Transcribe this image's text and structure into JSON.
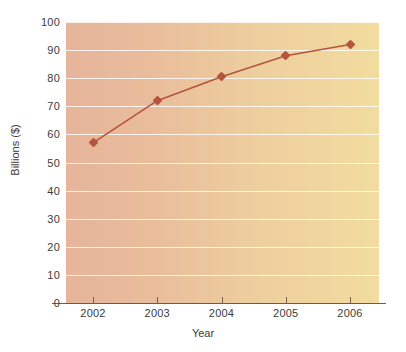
{
  "chart_data": {
    "type": "line",
    "title": "",
    "subtitle": "",
    "xlabel": "Year",
    "ylabel": "Billions ($)",
    "categories": [
      "2002",
      "2003",
      "2004",
      "2005",
      "2006"
    ],
    "x": [
      2002,
      2003,
      2004,
      2005,
      2006
    ],
    "values": [
      57,
      72,
      80.5,
      88,
      92
    ],
    "series": [
      {
        "name": "Billions ($)",
        "values": [
          57,
          72,
          80.5,
          88,
          92
        ],
        "color": "#b5543c",
        "marker": "diamond"
      }
    ],
    "ylim": [
      0,
      100
    ],
    "yticks": [
      0,
      10,
      20,
      30,
      40,
      50,
      60,
      70,
      80,
      90,
      100
    ],
    "ytick_labels": [
      "0",
      "10",
      "20",
      "30",
      "40",
      "50",
      "60",
      "70",
      "80",
      "90",
      "100"
    ],
    "xtick_labels": [
      "2002",
      "2003",
      "2004",
      "2005",
      "2006"
    ],
    "grid": "horizontal",
    "legend": "none",
    "annotations": []
  },
  "style": {
    "plot_bg_left": "#e6b49a",
    "plot_bg_right": "#f2dc9e",
    "gridline_color": "#ffffff",
    "series_color": "#b5543c",
    "axis_color": "#6b5a4e",
    "text_color": "#3b3b3b",
    "page_bg": "#ffffff"
  }
}
